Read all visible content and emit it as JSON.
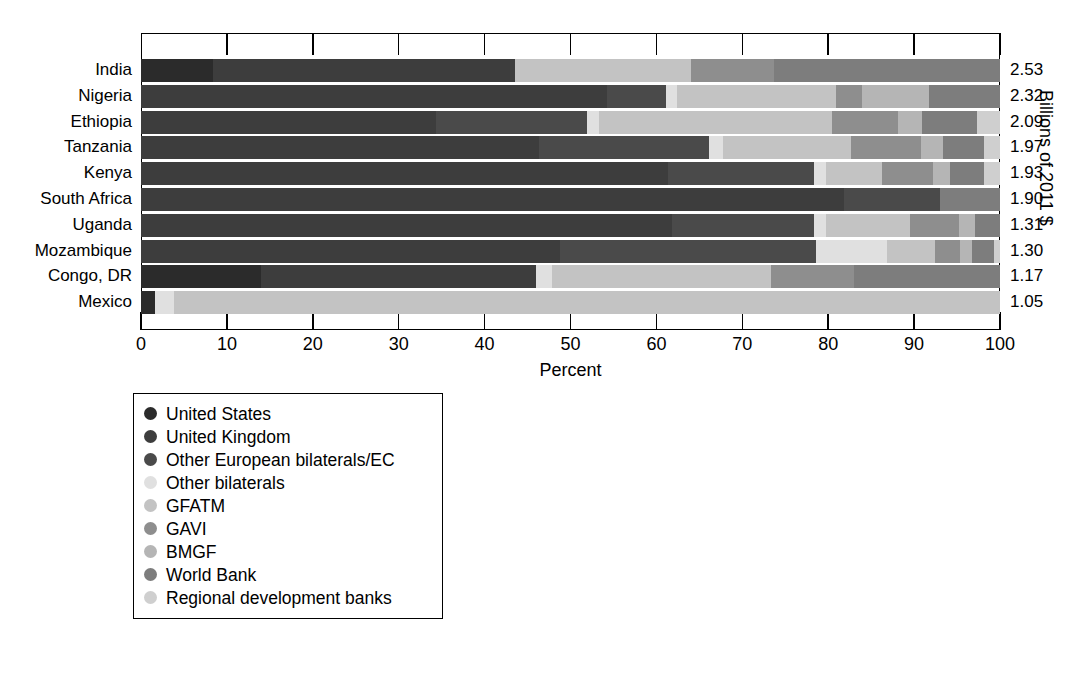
{
  "chart_data": {
    "type": "bar",
    "orientation": "horizontal",
    "stacked": true,
    "normalized": true,
    "title": "",
    "xlabel": "Percent",
    "ylabel": "",
    "y2label": "Billions of 2011 $",
    "xlim": [
      0,
      100
    ],
    "xticks": [
      0,
      10,
      20,
      30,
      40,
      50,
      60,
      70,
      80,
      90,
      100
    ],
    "grid": false,
    "legend_position": "below-left",
    "categories": [
      "India",
      "Nigeria",
      "Ethiopia",
      "Tanzania",
      "Kenya",
      "South Africa",
      "Uganda",
      "Mozambique",
      "Congo, DR",
      "Mexico"
    ],
    "value_labels": [
      "2.53",
      "2.32",
      "2.09",
      "1.97",
      "1.93",
      "1.90",
      "1.31",
      "1.30",
      "1.17",
      "1.05"
    ],
    "series": [
      {
        "name": "United States",
        "color": "#2b2b2b",
        "values": [
          8.4,
          0.0,
          0.0,
          0.0,
          0.0,
          0.0,
          0.0,
          0.0,
          14.0,
          1.6
        ]
      },
      {
        "name": "United Kingdom",
        "color": "#3d3d3d",
        "values": [
          35.1,
          54.2,
          34.3,
          46.3,
          61.3,
          81.8,
          61.8,
          48.8,
          32.0,
          0.0
        ]
      },
      {
        "name": "Other European bilaterals/EC",
        "color": "#4a4a4a",
        "values": [
          0.0,
          6.9,
          17.6,
          19.8,
          17.0,
          11.2,
          16.6,
          29.8,
          0.0,
          0.0
        ]
      },
      {
        "name": "Other bilaterals",
        "color": "#e0e0e0",
        "values": [
          0.0,
          1.3,
          1.4,
          1.7,
          1.5,
          0.0,
          1.3,
          8.3,
          1.8,
          2.2
        ]
      },
      {
        "name": "GFATM",
        "color": "#c3c3c3",
        "values": [
          20.5,
          18.5,
          27.2,
          14.9,
          6.5,
          0.0,
          9.8,
          5.5,
          25.6,
          96.2
        ]
      },
      {
        "name": "GAVI",
        "color": "#8e8e8e",
        "values": [
          9.7,
          3.0,
          7.6,
          8.1,
          5.9,
          0.0,
          5.7,
          2.9,
          9.6,
          0.0
        ]
      },
      {
        "name": "BMGF",
        "color": "#b5b5b5",
        "values": [
          0.0,
          7.8,
          2.8,
          2.6,
          2.0,
          0.0,
          1.9,
          1.5,
          0.0,
          0.0
        ]
      },
      {
        "name": "World Bank",
        "color": "#7d7d7d",
        "values": [
          26.3,
          8.3,
          6.4,
          4.8,
          3.9,
          7.0,
          2.9,
          2.5,
          17.0,
          0.0
        ]
      },
      {
        "name": "Regional development banks",
        "color": "#cfcfcf",
        "values": [
          0.0,
          0.0,
          2.7,
          1.8,
          1.9,
          0.0,
          0.0,
          0.7,
          0.0,
          0.0
        ]
      }
    ]
  }
}
